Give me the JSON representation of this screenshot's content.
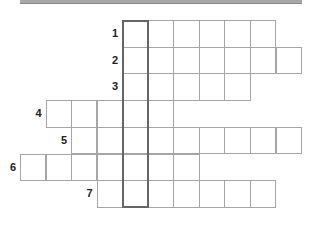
{
  "puzzle": {
    "title_bar": "",
    "highlight_column": 4,
    "rows": [
      {
        "number": "1",
        "start_col": 4,
        "length": 6,
        "answer": [
          "",
          "",
          "",
          "",
          "",
          ""
        ]
      },
      {
        "number": "2",
        "start_col": 4,
        "length": 7,
        "answer": [
          "",
          "",
          "",
          "",
          "",
          "",
          ""
        ]
      },
      {
        "number": "3",
        "start_col": 4,
        "length": 5,
        "answer": [
          "",
          "",
          "",
          "",
          ""
        ]
      },
      {
        "number": "4",
        "start_col": 1,
        "length": 5,
        "answer": [
          "",
          "",
          "",
          "",
          ""
        ]
      },
      {
        "number": "5",
        "start_col": 2,
        "length": 9,
        "answer": [
          "",
          "",
          "",
          "",
          "",
          "",
          "",
          "",
          ""
        ]
      },
      {
        "number": "6",
        "start_col": 0,
        "length": 7,
        "answer": [
          "",
          "",
          "",
          "",
          "",
          "",
          ""
        ]
      },
      {
        "number": "7",
        "start_col": 3,
        "length": 7,
        "answer": [
          "",
          "",
          "",
          "",
          "",
          "",
          ""
        ]
      }
    ]
  }
}
